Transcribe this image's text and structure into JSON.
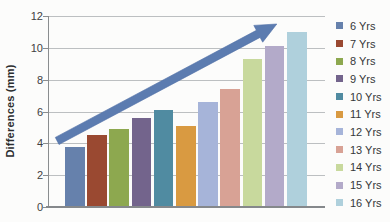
{
  "chart_data": {
    "type": "bar",
    "title": "",
    "xlabel": "",
    "ylabel": "Differences (mm)",
    "ylim": [
      0,
      12
    ],
    "yticks": [
      0,
      2,
      4,
      6,
      8,
      10,
      12
    ],
    "grid": true,
    "legend_position": "right",
    "categories": [
      "6 Yrs",
      "7 Yrs",
      "8 Yrs",
      "9 Yrs",
      "10 Yrs",
      "11 Yrs",
      "12 Yrs",
      "13 Yrs",
      "14 Yrs",
      "15 Yrs",
      "16 Yrs"
    ],
    "values": [
      3.8,
      4.5,
      4.9,
      5.6,
      6.1,
      5.1,
      6.6,
      7.4,
      9.3,
      10.1,
      11.0
    ],
    "bar_colors": [
      "#6681ac",
      "#9a4931",
      "#8da84f",
      "#73648c",
      "#508ba1",
      "#d99a41",
      "#a6b4d9",
      "#d8a295",
      "#c8d99d",
      "#b3aac9",
      "#afd0dc"
    ],
    "annotation": {
      "type": "trend-arrow",
      "color": "#5c7cb0",
      "edge_color": "#4f6fa6",
      "x_start_frac": 0.033,
      "y_start": 4.15,
      "x_end_frac": 0.826,
      "y_end": 11.5
    },
    "colors": {
      "grid": "#bcbfc1",
      "axis": "#8a8d8f",
      "tick_text": "#3f4142",
      "label_text": "#2b2d2f",
      "legend_text": "#353739",
      "background": "#fcfcfb"
    }
  }
}
